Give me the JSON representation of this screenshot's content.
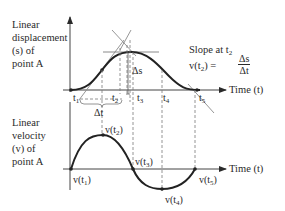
{
  "diagram": {
    "top_graph": {
      "ylabel_lines": [
        "Linear",
        "displacement",
        "(s) of",
        "point A"
      ],
      "xlabel": "Time (t)",
      "time_marks": [
        {
          "base": "t",
          "sub": "1"
        },
        {
          "base": "t",
          "sub": "2"
        },
        {
          "base": "t",
          "sub": "3"
        },
        {
          "base": "t",
          "sub": "4"
        },
        {
          "base": "t",
          "sub": "5"
        }
      ],
      "delta_s": "Δs",
      "delta_t": "Δt",
      "slope_note": {
        "line1_base": "Slope at t",
        "line1_sub": "2",
        "line2_prefix": "v(t",
        "line2_sub": "2",
        "line2_suffix": ") =",
        "frac_num": "Δs",
        "frac_den": "Δt"
      }
    },
    "bottom_graph": {
      "ylabel_lines": [
        "Linear",
        "velocity",
        "(v) of",
        "point A"
      ],
      "xlabel": "Time (t)",
      "point_labels": [
        {
          "prefix": "v(t",
          "sub": "1",
          "suffix": ")"
        },
        {
          "prefix": "v(t",
          "sub": "2",
          "suffix": ")"
        },
        {
          "prefix": "v(t",
          "sub": "3",
          "suffix": ")"
        },
        {
          "prefix": "v(t",
          "sub": "4",
          "suffix": ")"
        },
        {
          "prefix": "v(t",
          "sub": "5",
          "suffix": ")"
        }
      ]
    },
    "colors": {
      "ink": "#2a2a2a",
      "guide": "#7a7a7a",
      "tangent": "#8a8a8a"
    }
  }
}
